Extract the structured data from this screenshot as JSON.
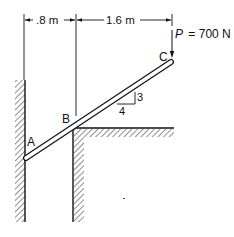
{
  "diagram": {
    "dimensions": {
      "left_span": ".8 m",
      "right_span": "1.6 m"
    },
    "load": {
      "label": "P = 700 N",
      "symbol": "P",
      "value": "= 700 N"
    },
    "points": {
      "A": "A",
      "B": "B",
      "C": "C"
    },
    "slope": {
      "rise": "3",
      "run": "4"
    },
    "colors": {
      "ink": "#111111",
      "background": "#ffffff"
    }
  }
}
